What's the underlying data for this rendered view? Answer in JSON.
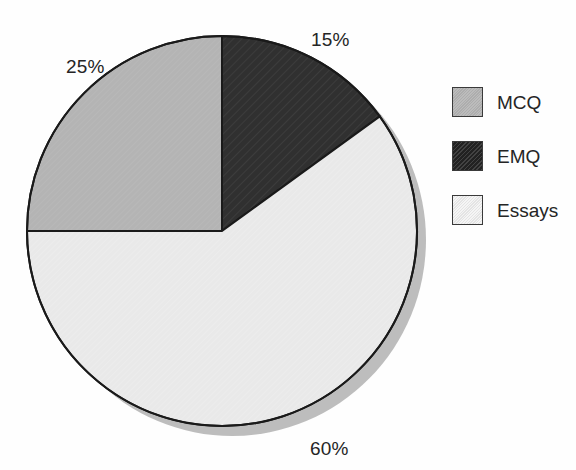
{
  "chart_data": {
    "type": "pie",
    "title": "",
    "subtitle": "",
    "xlabel": "",
    "ylabel": "",
    "grid": false,
    "legend_position": "right",
    "start_angle_deg": 0,
    "direction": "clockwise",
    "categories": [
      "EMQ",
      "Essays",
      "MCQ"
    ],
    "values": [
      15,
      60,
      25
    ],
    "units": "percent",
    "slices": [
      {
        "label": "EMQ",
        "value": 15,
        "value_text": "15%",
        "color": "#303030",
        "pattern": "diagonal-hatch",
        "start_deg": 0,
        "end_deg": 54
      },
      {
        "label": "Essays",
        "value": 60,
        "value_text": "60%",
        "color": "#e9e9e9",
        "pattern": "fine-texture",
        "start_deg": 54,
        "end_deg": 270
      },
      {
        "label": "MCQ",
        "value": 25,
        "value_text": "25%",
        "color": "#b4b4b4",
        "pattern": "fine-texture",
        "start_deg": 270,
        "end_deg": 360
      }
    ],
    "data_labels": [
      "15%",
      "25%",
      "60%"
    ],
    "legend_entries": [
      {
        "label": "MCQ",
        "color": "#b4b4b4"
      },
      {
        "label": "EMQ",
        "color": "#303030"
      },
      {
        "label": "Essays",
        "color": "#e9e9e9"
      }
    ]
  },
  "labels": {
    "emq_pct": "15%",
    "mcq_pct": "25%",
    "essays_pct": "60%"
  },
  "legend": {
    "items": [
      {
        "label": "MCQ"
      },
      {
        "label": "EMQ"
      },
      {
        "label": "Essays"
      }
    ]
  },
  "colors": {
    "background": "#fefefe",
    "outline": "#1a1a1a",
    "shadow": "#b9b9b9",
    "text": "#252525",
    "mcq": "#b4b4b4",
    "emq": "#303030",
    "essays": "#e9e9e9"
  }
}
